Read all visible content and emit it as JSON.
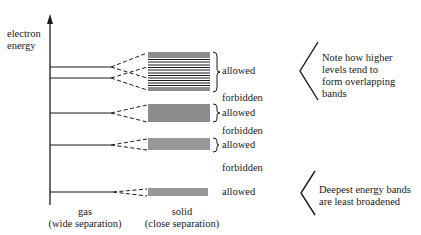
{
  "axis": {
    "label_line1": "electron",
    "label_line2": "energy"
  },
  "bottom_labels": {
    "gas_title": "gas",
    "gas_subtitle": "(wide separation)",
    "solid_title": "solid",
    "solid_subtitle": "(close separation)"
  },
  "band_labels": [
    {
      "text": "allowed"
    },
    {
      "text": "forbidden"
    },
    {
      "text": "allowed"
    },
    {
      "text": "forbidden"
    },
    {
      "text": "allowed"
    },
    {
      "text": "forbidden"
    },
    {
      "text": "allowed"
    }
  ],
  "notes": {
    "top": "Note how higher levels tend to form overlapping bands",
    "bottom": "Deepest energy bands are least broadened"
  },
  "colors": {
    "ink": "#1a1a1a",
    "background": "#ffffff"
  }
}
